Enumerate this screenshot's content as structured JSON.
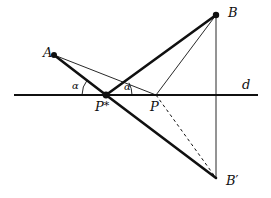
{
  "figure": {
    "kind": "geometry-diagram",
    "width": 271,
    "height": 198,
    "background_color": "#ffffff",
    "ink_color": "#101010"
  },
  "labels": {
    "point_a": "A",
    "point_b": "B",
    "point_b_prime_base": "B",
    "point_b_prime_mark": "′",
    "point_p": "P",
    "point_p_star_base": "P",
    "point_p_star_mark": "*",
    "line_d": "d",
    "angle_left": "α",
    "angle_right": "α"
  },
  "geometry": {
    "points": {
      "A": {
        "x": 54,
        "y": 55,
        "dot": true,
        "dot_r": 3.0
      },
      "B": {
        "x": 216,
        "y": 15,
        "dot": true,
        "dot_r": 3.2
      },
      "B_prime": {
        "x": 216,
        "y": 178,
        "dot": false,
        "dot_r": 0
      },
      "P_star": {
        "x": 106,
        "y": 95,
        "dot": true,
        "dot_r": 3.4
      },
      "P": {
        "x": 156,
        "y": 95,
        "dot": false,
        "dot_r": 0
      }
    },
    "line_d": {
      "x1": 14,
      "y1": 95,
      "x2": 258,
      "y2": 95,
      "width": 2.2
    },
    "segments": [
      {
        "name": "A-to-Pstar",
        "from": "A",
        "to": "P_star",
        "style": "thick",
        "width": 2.6
      },
      {
        "name": "Pstar-to-B",
        "from": "P_star",
        "to": "B",
        "style": "thick",
        "width": 2.6
      },
      {
        "name": "Pstar-to-Bprime",
        "from": "P_star",
        "to": "B_prime",
        "style": "thick",
        "width": 2.6
      },
      {
        "name": "A-to-P",
        "from": "A",
        "to": "P",
        "style": "thin",
        "width": 0.9
      },
      {
        "name": "P-to-B",
        "from": "P",
        "to": "B",
        "style": "thin",
        "width": 0.9
      },
      {
        "name": "B-to-Bprime-vertical",
        "from": "B",
        "to": "B_prime",
        "style": "thin",
        "width": 0.9
      },
      {
        "name": "P-to-Bprime",
        "from": "P",
        "to": "B_prime",
        "style": "dashed",
        "width": 1.0,
        "dash": "3,3"
      }
    ],
    "angle_arcs": [
      {
        "name": "angle-alpha-left",
        "vertex": "P_star",
        "radius": 24,
        "start_deg": 180,
        "end_deg": 141
      },
      {
        "name": "angle-alpha-right",
        "vertex": "P_star",
        "radius": 26,
        "start_deg": 0,
        "end_deg": 28
      }
    ]
  },
  "label_positions": {
    "A": {
      "x": 43,
      "y": 46
    },
    "B": {
      "x": 228,
      "y": 6
    },
    "B_prime": {
      "x": 226,
      "y": 174
    },
    "P": {
      "x": 150,
      "y": 100
    },
    "P_star": {
      "x": 95,
      "y": 100
    },
    "d": {
      "x": 242,
      "y": 78
    },
    "alpha_left": {
      "x": 72,
      "y": 81
    },
    "alpha_right": {
      "x": 124,
      "y": 82
    }
  }
}
